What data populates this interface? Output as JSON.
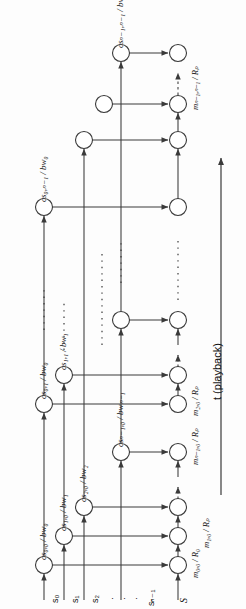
{
  "figure": {
    "type": "diagram",
    "orientation": "rotated-90-ccw",
    "axis": {
      "time_label": "t (playback)",
      "time_arrow": "up"
    },
    "stream_axis_labels": [
      {
        "id": "s0",
        "text": "s₀"
      },
      {
        "id": "s1",
        "text": "s₁"
      },
      {
        "id": "s2",
        "text": "s₂"
      },
      {
        "id": "dots1",
        "text": "·"
      },
      {
        "id": "dots2",
        "text": "·"
      },
      {
        "id": "dots3",
        "text": "·"
      },
      {
        "id": "sN1",
        "text": "sₙ₋₁"
      },
      {
        "id": "S",
        "text": "S"
      }
    ],
    "chunk_labels": [
      {
        "id": "cs-0-0",
        "text": "cs₀,₀ / bw₀"
      },
      {
        "id": "cs-1-0",
        "text": "cs₁,₀ / bw₁"
      },
      {
        "id": "cs-2-0",
        "text": "cs₂,₀ / bw₂"
      },
      {
        "id": "cs-N1-0",
        "text": "csₙ₋₁,₀ / bwₙ₋₁"
      },
      {
        "id": "cs-0-1",
        "text": "cs₀,₁ / bw₀"
      },
      {
        "id": "cs-1-1",
        "text": "cs₁,₁ / bw₁"
      },
      {
        "id": "cs-0-n1",
        "text": "cs₀,ₙ₋₁ / bw₀"
      },
      {
        "id": "cs-N1-n1",
        "text": "csₙ₋₁,ₙ₋₁ / bwₙ₋₁"
      }
    ],
    "merge_labels": [
      {
        "id": "m-0-0",
        "text": "m₀,₀ / R₀"
      },
      {
        "id": "m-1-0",
        "text": "m₁,₀ / Rₚ"
      },
      {
        "id": "m-2-0",
        "text": "m₂,₀ / Rₚ"
      },
      {
        "id": "m-N1-0",
        "text": "mₙ₋₁,₀ / Rₚ"
      },
      {
        "id": "m-N1-n1",
        "text": "mₙ₋₁,ₙ₋₁ / Rₚ"
      }
    ],
    "colors": {
      "stroke": "#3a3a3a",
      "node_fill": "#ffffff",
      "background": "#fdfdfd",
      "text": "#111111"
    },
    "counts": {
      "nodes": 14,
      "columns": 6,
      "rows": 4
    }
  }
}
